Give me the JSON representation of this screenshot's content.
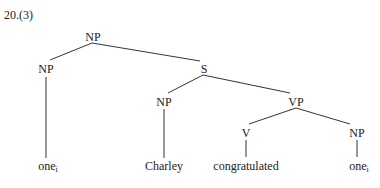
{
  "example_number": "20.(3)",
  "tree": {
    "nodes": {
      "root_np": {
        "label": "NP",
        "x": 93,
        "y": 31
      },
      "left_np": {
        "label": "NP",
        "x": 46,
        "y": 63
      },
      "s": {
        "label": "S",
        "x": 204,
        "y": 64
      },
      "inner_np": {
        "label": "NP",
        "x": 164,
        "y": 96
      },
      "vp": {
        "label": "VP",
        "x": 296,
        "y": 96
      },
      "v": {
        "label": "V",
        "x": 246,
        "y": 127
      },
      "obj_np": {
        "label": "NP",
        "x": 357,
        "y": 127
      }
    },
    "leaves": {
      "leaf_one_left": {
        "word": "one",
        "subscript": "i",
        "x": 46,
        "y": 164
      },
      "leaf_charley": {
        "word": "Charley",
        "x": 164,
        "y": 164
      },
      "leaf_congratulated": {
        "word": "congratulated",
        "x": 246,
        "y": 164
      },
      "leaf_one_right": {
        "word": "one",
        "subscript": "i",
        "x": 357,
        "y": 164
      }
    },
    "edges": [
      {
        "from": "root_np",
        "to": "left_np",
        "x1": 92,
        "y1": 43,
        "x2": 50,
        "y2": 60
      },
      {
        "from": "root_np",
        "to": "s",
        "x1": 92,
        "y1": 43,
        "x2": 200,
        "y2": 61
      },
      {
        "from": "left_np",
        "to": "leaf_one_left",
        "x1": 46,
        "y1": 77,
        "x2": 46,
        "y2": 158
      },
      {
        "from": "s",
        "to": "inner_np",
        "x1": 203,
        "y1": 75,
        "x2": 168,
        "y2": 93
      },
      {
        "from": "s",
        "to": "vp",
        "x1": 203,
        "y1": 75,
        "x2": 290,
        "y2": 93
      },
      {
        "from": "inner_np",
        "to": "leaf_charley",
        "x1": 164,
        "y1": 109,
        "x2": 164,
        "y2": 158
      },
      {
        "from": "vp",
        "to": "v",
        "x1": 296,
        "y1": 108,
        "x2": 249,
        "y2": 124
      },
      {
        "from": "vp",
        "to": "obj_np",
        "x1": 296,
        "y1": 108,
        "x2": 350,
        "y2": 124
      },
      {
        "from": "v",
        "to": "leaf_congratulated",
        "x1": 246,
        "y1": 140,
        "x2": 246,
        "y2": 157
      },
      {
        "from": "obj_np",
        "to": "leaf_one_right",
        "x1": 357,
        "y1": 140,
        "x2": 357,
        "y2": 157
      }
    ]
  }
}
